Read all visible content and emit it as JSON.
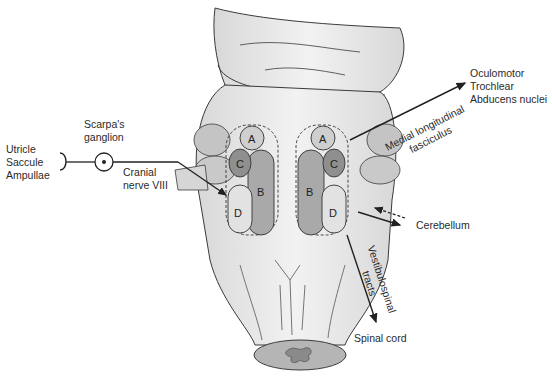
{
  "diagram": {
    "left_labels": {
      "receptors": [
        "Utricle",
        "Saccule",
        "Ampullae"
      ],
      "ganglion": [
        "Scarpa's",
        "ganglion"
      ],
      "nerve": [
        "Cranial",
        "nerve VIII"
      ]
    },
    "right_labels": {
      "nuclei_targets": [
        "Oculomotor",
        "Trochlear",
        "Abducens nuclei"
      ],
      "mlf": [
        "Medial longitudinal",
        "fasciculus"
      ],
      "cerebellum": "Cerebellum",
      "vestibulospinal": [
        "Vestibulospinal",
        "tracts"
      ],
      "spinal_cord": "Spinal cord"
    },
    "nuclei_left": [
      "A",
      "C",
      "B",
      "D"
    ],
    "nuclei_right": [
      "A",
      "C",
      "B",
      "D"
    ],
    "colors": {
      "brainstem_fill": "#e6e6e6",
      "outline": "#3a3a3a",
      "nucleus_A": "#cfcfcf",
      "nucleus_B": "#a9a9a9",
      "nucleus_C": "#8f8f8f",
      "nucleus_D": "#e2e2e2",
      "peduncle": "#c4c4c4",
      "arrow": "#222222"
    }
  }
}
